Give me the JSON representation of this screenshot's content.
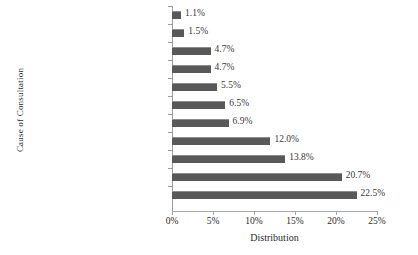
{
  "chart_data": {
    "type": "bar",
    "orientation": "horizontal",
    "title": "",
    "xlabel": "Distribution",
    "ylabel": "Cause of Consultation",
    "xlim": [
      0,
      25
    ],
    "xticks": [
      "0%",
      "5%",
      "10%",
      "15%",
      "20%",
      "25%"
    ],
    "xtick_values": [
      0,
      5,
      10,
      15,
      20,
      25
    ],
    "grid": false,
    "legend": false,
    "bar_color": "#595959",
    "axis_color": "#a9a9a9",
    "categories": [
      "halitosis",
      "chewing difficulties",
      "denture missing",
      "oral hygiene",
      "other&not specified",
      "lack of denture retention",
      "denture reline and repair",
      "problem with natural tooth",
      "check-up visit",
      "denture fabrication",
      "pain/ toothache"
    ],
    "values": [
      1.1,
      1.5,
      4.7,
      4.7,
      5.5,
      6.5,
      6.9,
      12.0,
      13.8,
      20.7,
      22.5
    ],
    "value_labels": [
      "1.1%",
      "1.5%",
      "4.7%",
      "4.7%",
      "5.5%",
      "6.5%",
      "6.9%",
      "12.0%",
      "13.8%",
      "20.7%",
      "22.5%"
    ]
  }
}
